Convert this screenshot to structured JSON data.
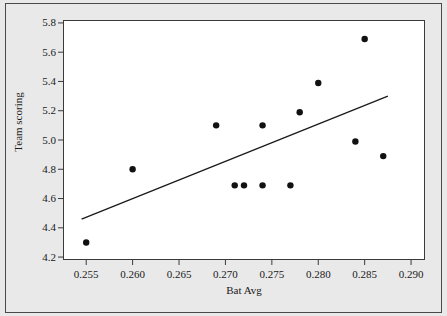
{
  "chart_data": {
    "type": "scatter",
    "title": "",
    "xlabel": "Bat Avg",
    "ylabel": "Team scoring",
    "xlim": [
      0.2525,
      0.2915
    ],
    "ylim": [
      4.18,
      5.82
    ],
    "xticks": [
      0.255,
      0.26,
      0.265,
      0.27,
      0.275,
      0.28,
      0.285,
      0.29
    ],
    "xtick_labels": [
      "0.255",
      "0.260",
      "0.265",
      "0.270",
      "0.275",
      "0.280",
      "0.285",
      "0.290"
    ],
    "yticks": [
      4.2,
      4.4,
      4.6,
      4.8,
      5.0,
      5.2,
      5.4,
      5.6,
      5.8
    ],
    "ytick_labels": [
      "4.2",
      "4.4",
      "4.6",
      "4.8",
      "5.0",
      "5.2",
      "5.4",
      "5.6",
      "5.8"
    ],
    "grid": false,
    "legend": null,
    "marker": "filled-circle",
    "marker_color": "#111111",
    "points": [
      {
        "x": 0.255,
        "y": 4.3
      },
      {
        "x": 0.26,
        "y": 4.8
      },
      {
        "x": 0.269,
        "y": 5.1
      },
      {
        "x": 0.271,
        "y": 4.69
      },
      {
        "x": 0.272,
        "y": 4.69
      },
      {
        "x": 0.274,
        "y": 4.69
      },
      {
        "x": 0.274,
        "y": 5.1
      },
      {
        "x": 0.277,
        "y": 4.69
      },
      {
        "x": 0.278,
        "y": 5.19
      },
      {
        "x": 0.28,
        "y": 5.39
      },
      {
        "x": 0.284,
        "y": 4.99
      },
      {
        "x": 0.285,
        "y": 5.69
      },
      {
        "x": 0.287,
        "y": 4.89
      }
    ],
    "trend_line": {
      "type": "linear-fit",
      "color": "#1a1a1a",
      "x_start": 0.2545,
      "y_start": 4.46,
      "x_end": 0.2875,
      "y_end": 5.3
    }
  },
  "figure": {
    "background_color": "#e9e9e9",
    "plot_background_color": "#ffffff",
    "border_color": "#4a4a4a"
  }
}
